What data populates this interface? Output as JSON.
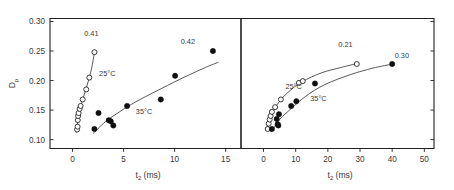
{
  "chart_data": {
    "type": "scatter",
    "title": "",
    "panels": [
      {
        "name": "left-panel",
        "xlabel": "t2 (ms)",
        "xlabel_main": "t",
        "xlabel_sub": "2",
        "xlabel_unit": "(ms)",
        "ylabel": "Dp",
        "ylabel_main": "D",
        "ylabel_sub": "p",
        "xlim": [
          -2.2,
          16.5
        ],
        "ylim": [
          0.085,
          0.305
        ],
        "xticks": [
          0,
          5,
          10,
          15
        ],
        "xtick_labels": [
          "0",
          "5",
          "10",
          "15"
        ],
        "yticks": [
          0.1,
          0.15,
          0.2,
          0.25,
          0.3
        ],
        "ytick_labels": [
          "0.10",
          "0.15",
          "0.20",
          "0.25",
          "0.30"
        ],
        "grid": false,
        "legend": "inline-annotations",
        "series": [
          {
            "name": "25°C",
            "marker": "open-circle",
            "label": "25°C",
            "label_x": 2.6,
            "label_y": 0.208,
            "points": [
              {
                "x": 0.45,
                "y": 0.117
              },
              {
                "x": 0.5,
                "y": 0.122
              },
              {
                "x": 0.52,
                "y": 0.133
              },
              {
                "x": 0.55,
                "y": 0.14
              },
              {
                "x": 0.6,
                "y": 0.145
              },
              {
                "x": 0.7,
                "y": 0.152
              },
              {
                "x": 0.8,
                "y": 0.157
              },
              {
                "x": 1.0,
                "y": 0.168
              },
              {
                "x": 1.35,
                "y": 0.185
              },
              {
                "x": 1.65,
                "y": 0.205
              },
              {
                "x": 2.15,
                "y": 0.248
              }
            ],
            "fit_curve": [
              {
                "x": 0.4,
                "y": 0.112
              },
              {
                "x": 0.6,
                "y": 0.14
              },
              {
                "x": 0.85,
                "y": 0.159
              },
              {
                "x": 1.15,
                "y": 0.176
              },
              {
                "x": 1.5,
                "y": 0.196
              },
              {
                "x": 1.85,
                "y": 0.219
              },
              {
                "x": 2.18,
                "y": 0.25
              }
            ],
            "endpoint_label": "0.41",
            "endpoint_label_x": 1.85,
            "endpoint_label_y": 0.276
          },
          {
            "name": "35°C",
            "marker": "filled-circle",
            "label": "35°C",
            "label_x": 6.2,
            "label_y": 0.143,
            "points": [
              {
                "x": 2.15,
                "y": 0.118
              },
              {
                "x": 2.55,
                "y": 0.145
              },
              {
                "x": 3.55,
                "y": 0.133
              },
              {
                "x": 3.75,
                "y": 0.131
              },
              {
                "x": 4.0,
                "y": 0.124
              },
              {
                "x": 5.35,
                "y": 0.157
              },
              {
                "x": 8.65,
                "y": 0.168
              },
              {
                "x": 10.05,
                "y": 0.208
              },
              {
                "x": 13.75,
                "y": 0.25
              }
            ],
            "fit_curve": [
              {
                "x": 2.0,
                "y": 0.11
              },
              {
                "x": 3.2,
                "y": 0.13
              },
              {
                "x": 4.6,
                "y": 0.147
              },
              {
                "x": 6.2,
                "y": 0.164
              },
              {
                "x": 8.2,
                "y": 0.182
              },
              {
                "x": 10.5,
                "y": 0.202
              },
              {
                "x": 13.0,
                "y": 0.222
              },
              {
                "x": 14.3,
                "y": 0.231
              }
            ],
            "endpoint_label": "0.42",
            "endpoint_label_x": 11.3,
            "endpoint_label_y": 0.262
          }
        ]
      },
      {
        "name": "right-panel",
        "xlabel": "t2 (ms)",
        "xlabel_main": "t",
        "xlabel_sub": "2",
        "xlabel_unit": "(ms)",
        "xlim": [
          -7.0,
          53.0
        ],
        "ylim": [
          0.085,
          0.305
        ],
        "xticks": [
          0,
          10,
          20,
          30,
          40,
          50
        ],
        "xtick_labels": [
          "0",
          "10",
          "20",
          "30",
          "40",
          "50"
        ],
        "yticks": [
          0.1,
          0.15,
          0.2,
          0.25,
          0.3
        ],
        "grid": false,
        "legend": "inline-annotations",
        "series": [
          {
            "name": "25°C",
            "marker": "open-circle",
            "label": "25°C",
            "label_x": 6.8,
            "label_y": 0.186,
            "points": [
              {
                "x": 1.3,
                "y": 0.118
              },
              {
                "x": 1.6,
                "y": 0.127
              },
              {
                "x": 1.9,
                "y": 0.134
              },
              {
                "x": 2.2,
                "y": 0.14
              },
              {
                "x": 2.6,
                "y": 0.147
              },
              {
                "x": 3.6,
                "y": 0.155
              },
              {
                "x": 5.4,
                "y": 0.168
              },
              {
                "x": 11.0,
                "y": 0.196
              },
              {
                "x": 12.2,
                "y": 0.199
              },
              {
                "x": 29.0,
                "y": 0.228
              }
            ],
            "fit_curve": [
              {
                "x": 1.2,
                "y": 0.116
              },
              {
                "x": 2.6,
                "y": 0.143
              },
              {
                "x": 4.6,
                "y": 0.162
              },
              {
                "x": 7.6,
                "y": 0.18
              },
              {
                "x": 12.0,
                "y": 0.198
              },
              {
                "x": 18.0,
                "y": 0.213
              },
              {
                "x": 24.0,
                "y": 0.222
              },
              {
                "x": 29.2,
                "y": 0.229
              }
            ],
            "endpoint_label": "0.21",
            "endpoint_label_x": 25.5,
            "endpoint_label_y": 0.256
          },
          {
            "name": "35°C",
            "marker": "filled-circle",
            "label": "35°C",
            "label_x": 14.5,
            "label_y": 0.166,
            "points": [
              {
                "x": 2.6,
                "y": 0.118
              },
              {
                "x": 4.1,
                "y": 0.135
              },
              {
                "x": 4.4,
                "y": 0.126
              },
              {
                "x": 4.6,
                "y": 0.124
              },
              {
                "x": 4.8,
                "y": 0.143
              },
              {
                "x": 8.6,
                "y": 0.157
              },
              {
                "x": 10.2,
                "y": 0.165
              },
              {
                "x": 16.0,
                "y": 0.195
              },
              {
                "x": 40.0,
                "y": 0.228
              }
            ],
            "fit_curve": [
              {
                "x": 2.4,
                "y": 0.113
              },
              {
                "x": 5.0,
                "y": 0.134
              },
              {
                "x": 8.5,
                "y": 0.152
              },
              {
                "x": 13.0,
                "y": 0.173
              },
              {
                "x": 19.0,
                "y": 0.193
              },
              {
                "x": 27.0,
                "y": 0.21
              },
              {
                "x": 34.0,
                "y": 0.221
              },
              {
                "x": 40.2,
                "y": 0.228
              }
            ],
            "endpoint_label": "0.30",
            "endpoint_label_x": 43.0,
            "endpoint_label_y": 0.238
          }
        ]
      }
    ]
  }
}
